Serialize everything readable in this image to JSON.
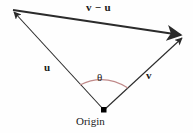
{
  "figure": {
    "background_color": "#fefefe",
    "stroke_color": "#2b2b2b",
    "arc_color": "#c08a8a",
    "origin_dot_color": "#000000"
  },
  "labels": {
    "difference_vector": "v − u",
    "vector_u": "u",
    "vector_v": "v",
    "angle": "θ",
    "origin": "Origin"
  },
  "diagram_data": {
    "type": "vector-diagram",
    "points": {
      "origin": [
        104,
        110
      ],
      "u_tip": [
        10,
        9
      ],
      "v_tip": [
        186,
        36
      ]
    },
    "vectors": [
      {
        "name": "u",
        "from": "origin",
        "to": "u_tip",
        "label": "u",
        "arrowhead": "at-tip"
      },
      {
        "name": "v",
        "from": "origin",
        "to": "v_tip",
        "label": "v",
        "arrowhead": "at-tip"
      },
      {
        "name": "v-minus-u",
        "from": "u_tip",
        "to": "v_tip",
        "label": "v − u",
        "arrowhead": "at-tip"
      }
    ],
    "angle_arc": {
      "at": "origin",
      "label": "θ",
      "between": [
        "u",
        "v"
      ],
      "color": "#c08a8a"
    }
  }
}
